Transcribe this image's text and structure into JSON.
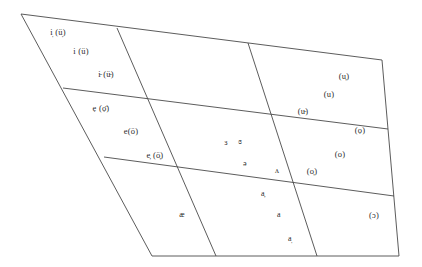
{
  "diagram": {
    "type": "vowel-quadrilateral",
    "stroke_color": "#4a4a4a",
    "text_color": "#2b2b2b",
    "background_color": "#ffffff",
    "outline": {
      "top_left": [
        21,
        14
      ],
      "top_right": [
        382,
        60
      ],
      "bottom_right": [
        399,
        256
      ],
      "bottom_left": [
        152,
        256
      ]
    },
    "horizontal_dividers": [
      {
        "name": "close-to-mid-divider",
        "from": [
          63,
          88
        ],
        "to": [
          388,
          129
        ]
      },
      {
        "name": "mid-to-open-divider",
        "from": [
          104,
          157
        ],
        "to": [
          394,
          196
        ]
      }
    ],
    "vertical_dividers": [
      {
        "name": "front-to-central-divider",
        "from": [
          117,
          28
        ],
        "to": [
          216,
          256
        ]
      },
      {
        "name": "central-to-back-divider",
        "from": [
          248,
          43
        ],
        "to": [
          317,
          256
        ]
      }
    ],
    "labels": [
      {
        "id": "close-front-raised",
        "text": "i̩ (ü̩)",
        "x": 58,
        "y": 32
      },
      {
        "id": "close-front",
        "text": "i (ü)",
        "x": 81,
        "y": 51
      },
      {
        "id": "close-front-lowered",
        "text": "i̵ (ü̵)",
        "x": 106,
        "y": 74
      },
      {
        "id": "close-mid-front-raised",
        "text": "ẹ (ọ̈)",
        "x": 101,
        "y": 108
      },
      {
        "id": "close-mid-front",
        "text": "e(ö)",
        "x": 131,
        "y": 131
      },
      {
        "id": "close-mid-front-lowered",
        "text": "e̦ (ö̦)",
        "x": 155,
        "y": 155
      },
      {
        "id": "open-front",
        "text": "æ",
        "x": 182,
        "y": 215
      },
      {
        "id": "mid-central-unrounded",
        "text": "ɜ",
        "x": 226,
        "y": 143
      },
      {
        "id": "mid-central-rounded",
        "text": "ɞ",
        "x": 240,
        "y": 142
      },
      {
        "id": "schwa",
        "text": "ə",
        "x": 245,
        "y": 164
      },
      {
        "id": "open-mid-back-unrounded",
        "text": "ʌ",
        "x": 277,
        "y": 171
      },
      {
        "id": "open-central-raised",
        "text": "a̦",
        "x": 263,
        "y": 194
      },
      {
        "id": "open-central",
        "text": "a",
        "x": 279,
        "y": 215
      },
      {
        "id": "open-central-lowered",
        "text": "a̩",
        "x": 290,
        "y": 239
      },
      {
        "id": "close-back-raised",
        "text": "(u̦)",
        "x": 344,
        "y": 76
      },
      {
        "id": "close-back",
        "text": "(u)",
        "x": 329,
        "y": 94
      },
      {
        "id": "close-back-lowered",
        "text": "(u̵)",
        "x": 303,
        "y": 111
      },
      {
        "id": "close-mid-back-raised",
        "text": "(ọ)",
        "x": 360,
        "y": 130
      },
      {
        "id": "close-mid-back",
        "text": "(o)",
        "x": 340,
        "y": 154
      },
      {
        "id": "close-mid-back-lowered",
        "text": "(o̦)",
        "x": 312,
        "y": 171
      },
      {
        "id": "open-mid-back-rounded",
        "text": "(ɔ)",
        "x": 374,
        "y": 215
      }
    ]
  }
}
